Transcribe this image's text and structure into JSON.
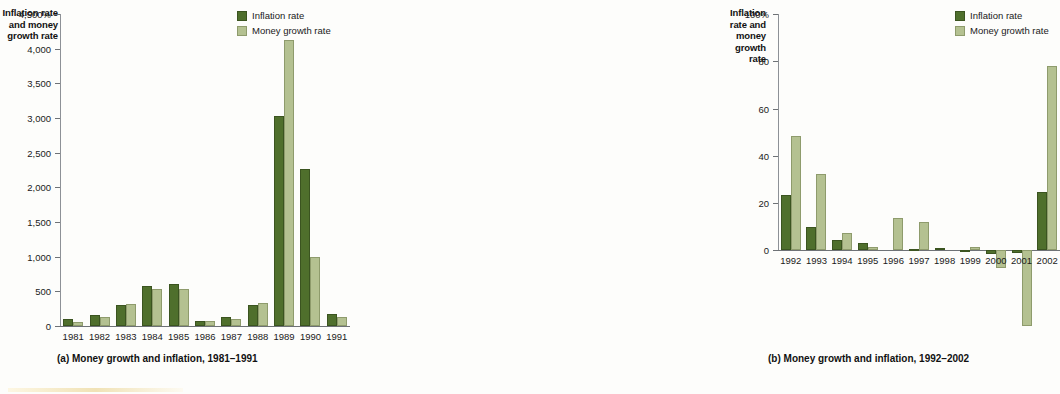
{
  "legend": {
    "inflation_label": "Inflation rate",
    "money_label": "Money growth rate",
    "inflation_color": "#4f6f2c",
    "money_color": "#b4c191"
  },
  "panel_a": {
    "axis_title": "Inflation rate and money growth rate",
    "caption": "(a) Money growth and inflation, 1981–1991",
    "ytick_labels": [
      "4,500%",
      "4,000",
      "3,500",
      "3,000",
      "2,500",
      "2,000",
      "1,500",
      "1,000",
      "500",
      "0"
    ]
  },
  "panel_b": {
    "axis_title": "Inflation rate and money growth rate",
    "caption": "(b) Money growth and inflation, 1992–2002",
    "ytick_labels": [
      "100%",
      "80",
      "60",
      "40",
      "20",
      "0"
    ]
  },
  "chart_data": [
    {
      "type": "bar",
      "id": "panel-a",
      "title": "(a) Money growth and inflation, 1981–1991",
      "xlabel": "",
      "ylabel": "Inflation rate and money growth rate",
      "ylim": [
        0,
        4500
      ],
      "yticks": [
        0,
        500,
        1000,
        1500,
        2000,
        2500,
        3000,
        3500,
        4000,
        4500
      ],
      "ytick_labels": [
        "0",
        "500",
        "1,000",
        "1,500",
        "2,000",
        "2,500",
        "3,000",
        "3,500",
        "4,000",
        "4,500%"
      ],
      "grid": false,
      "legend_position": "top-right",
      "categories": [
        "1981",
        "1982",
        "1983",
        "1984",
        "1985",
        "1986",
        "1987",
        "1988",
        "1989",
        "1990",
        "1991"
      ],
      "series": [
        {
          "name": "Inflation rate",
          "color": "#4f6f2c",
          "values": [
            100,
            165,
            310,
            570,
            610,
            75,
            130,
            310,
            3030,
            2270,
            170
          ]
        },
        {
          "name": "Money growth rate",
          "color": "#b4c191",
          "values": [
            55,
            130,
            320,
            535,
            530,
            70,
            100,
            325,
            4130,
            990,
            135
          ]
        }
      ]
    },
    {
      "type": "bar",
      "id": "panel-b",
      "title": "(b) Money growth and inflation, 1992–2002",
      "xlabel": "",
      "ylabel": "Inflation rate and money growth rate",
      "ylim": [
        -32,
        100
      ],
      "yticks": [
        0,
        20,
        40,
        60,
        80,
        100
      ],
      "ytick_labels": [
        "0",
        "20",
        "40",
        "60",
        "80",
        "100%"
      ],
      "grid": false,
      "legend_position": "top-right",
      "categories": [
        "1992",
        "1993",
        "1994",
        "1995",
        "1996",
        "1997",
        "1998",
        "1999",
        "2000",
        "2001",
        "2002"
      ],
      "series": [
        {
          "name": "Inflation rate",
          "color": "#4f6f2c",
          "values": [
            23.5,
            10,
            4.2,
            3.1,
            0,
            0.5,
            1,
            -0.8,
            -1.5,
            -1.2,
            24.5
          ]
        },
        {
          "name": "Money growth rate",
          "color": "#b4c191",
          "values": [
            48.5,
            32.3,
            7.4,
            1.3,
            13.7,
            12.1,
            0,
            1.6,
            -7.5,
            -32,
            78
          ]
        }
      ]
    }
  ]
}
